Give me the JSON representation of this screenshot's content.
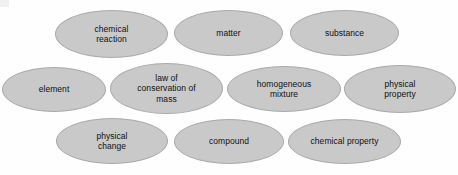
{
  "diagram": {
    "type": "vocabulary-word-bank",
    "background_color": "#fefefe",
    "bubble_fill_color": "#c9c9c9",
    "bubble_border_color": "#a9a9a9",
    "text_color": "#101010",
    "bubbles": [
      {
        "id": "chemical-reaction",
        "label": "chemical\nreaction",
        "row": 1,
        "x": 55,
        "y": 10,
        "w": 113,
        "h": 48
      },
      {
        "id": "matter",
        "label": "matter",
        "row": 1,
        "x": 174,
        "y": 10,
        "w": 109,
        "h": 46
      },
      {
        "id": "substance",
        "label": "substance",
        "row": 1,
        "x": 290,
        "y": 10,
        "w": 109,
        "h": 46
      },
      {
        "id": "element",
        "label": "element",
        "row": 2,
        "x": 2,
        "y": 67,
        "w": 104,
        "h": 45
      },
      {
        "id": "law-of-conservation-of-mass",
        "label": "law of\nconservation of\nmass",
        "row": 2,
        "x": 110,
        "y": 63,
        "w": 113,
        "h": 51
      },
      {
        "id": "homogeneous-mixture",
        "label": "homogeneous\nmixture",
        "row": 2,
        "x": 227,
        "y": 66,
        "w": 114,
        "h": 46
      },
      {
        "id": "physical-property",
        "label": "physical\nproperty",
        "row": 2,
        "x": 344,
        "y": 65,
        "w": 112,
        "h": 48
      },
      {
        "id": "physical-change",
        "label": "physical\nchange",
        "row": 3,
        "x": 56,
        "y": 118,
        "w": 112,
        "h": 46
      },
      {
        "id": "compound",
        "label": "compound",
        "row": 3,
        "x": 174,
        "y": 119,
        "w": 110,
        "h": 45
      },
      {
        "id": "chemical-property",
        "label": "chemical property",
        "row": 3,
        "x": 288,
        "y": 119,
        "w": 113,
        "h": 45
      }
    ]
  }
}
